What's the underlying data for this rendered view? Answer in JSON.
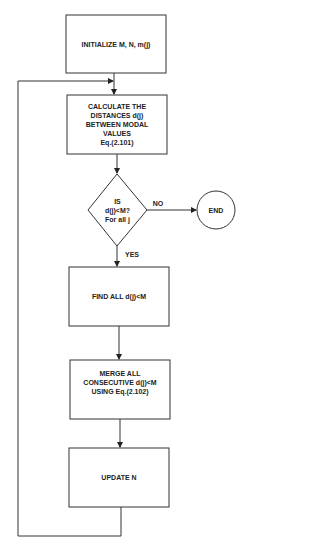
{
  "diagram": {
    "type": "flowchart",
    "nodes": [
      {
        "id": "init",
        "shape": "rect",
        "text": "INITIALIZE M, N, m(j)"
      },
      {
        "id": "calc",
        "shape": "rect",
        "text": "CALCULATE THE\nDISTANCES d(j)\nBETWEEN MODAL\nVALUES\nEq.(2.101)"
      },
      {
        "id": "decision",
        "shape": "diamond",
        "text": "IS\nd(j)<M?\nFor all j"
      },
      {
        "id": "end",
        "shape": "circle",
        "text": "END"
      },
      {
        "id": "find",
        "shape": "rect",
        "text": "FIND ALL d(j)<M"
      },
      {
        "id": "merge",
        "shape": "rect",
        "text": "MERGE ALL\nCONSECUTIVE d(j)<M\nUSING Eq.(2.102)"
      },
      {
        "id": "update",
        "shape": "rect",
        "text": "UPDATE N"
      }
    ],
    "edge_labels": {
      "no": "NO",
      "yes": "YES"
    },
    "edges": [
      {
        "from": "init",
        "to": "calc"
      },
      {
        "from": "calc",
        "to": "decision"
      },
      {
        "from": "decision",
        "to": "end",
        "label": "NO"
      },
      {
        "from": "decision",
        "to": "find",
        "label": "YES"
      },
      {
        "from": "find",
        "to": "merge"
      },
      {
        "from": "merge",
        "to": "update"
      },
      {
        "from": "update",
        "to": "calc",
        "label": ""
      }
    ],
    "colors": {
      "stroke": "#333333",
      "text": "#222222",
      "background": "#ffffff"
    }
  }
}
